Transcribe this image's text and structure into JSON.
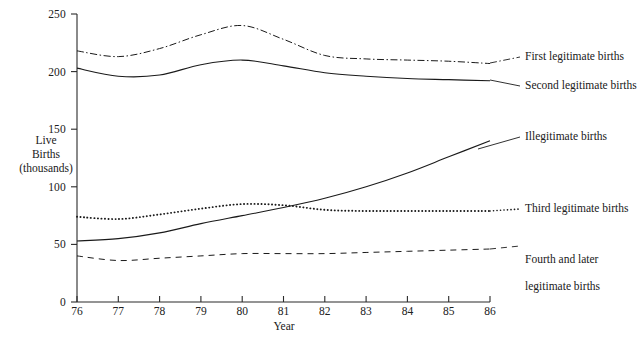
{
  "chart_data": {
    "type": "line",
    "title": "",
    "xlabel": "Year",
    "ylabel": "Live\nBirths\n(thousands)",
    "ylabel_lines": [
      "Live",
      "Births",
      "(thousands)"
    ],
    "x": [
      76,
      77,
      78,
      79,
      80,
      81,
      82,
      83,
      84,
      85,
      86
    ],
    "xtick_labels": [
      "76",
      "77",
      "78",
      "79",
      "80",
      "81",
      "82",
      "83",
      "84",
      "85",
      "86"
    ],
    "ytick_labels": [
      "0",
      "50",
      "100",
      "150",
      "200",
      "250"
    ],
    "yticks": [
      0,
      50,
      100,
      150,
      200,
      250
    ],
    "xlim": [
      76,
      86
    ],
    "ylim": [
      0,
      250
    ],
    "grid": false,
    "legend_position": "right-inline-labels",
    "series": [
      {
        "name": "First legitimate births",
        "style": "dash-dot",
        "label": "First legitimate births",
        "values": [
          218,
          213,
          220,
          232,
          240,
          228,
          214,
          211,
          210,
          209,
          207
        ]
      },
      {
        "name": "Second legitimate births",
        "style": "solid",
        "label": "Second legitimate births",
        "values": [
          203,
          196,
          197,
          206,
          210,
          205,
          199,
          196,
          194,
          193,
          192
        ]
      },
      {
        "name": "Illegitimate births",
        "style": "solid",
        "label": "Illegitimate births",
        "values": [
          53,
          55,
          60,
          68,
          75,
          82,
          90,
          100,
          112,
          126,
          140
        ]
      },
      {
        "name": "Third legitimate births",
        "style": "dotted",
        "label": "Third legitimate births",
        "values": [
          74,
          72,
          76,
          81,
          85,
          84,
          80,
          79,
          79,
          79,
          79
        ]
      },
      {
        "name": "Fourth and later legitimate births",
        "style": "dashed",
        "label": "Fourth and later\nlegitimate births",
        "values": [
          40,
          36,
          38,
          40,
          42,
          42,
          42,
          43,
          44,
          45,
          46
        ]
      }
    ]
  },
  "axis": {
    "y_label_line1": "Live",
    "y_label_line2": "Births",
    "y_label_line3": "(thousands)",
    "x_title": "Year"
  },
  "labels": {
    "first": "First legitimate births",
    "second": "Second legitimate births",
    "illegitimate": "Illegitimate births",
    "third": "Third legitimate births",
    "fourth_line1": "Fourth and later",
    "fourth_line2": "legitimate births"
  },
  "colors": {
    "ink": "#1a1a1a",
    "background": "#ffffff"
  }
}
